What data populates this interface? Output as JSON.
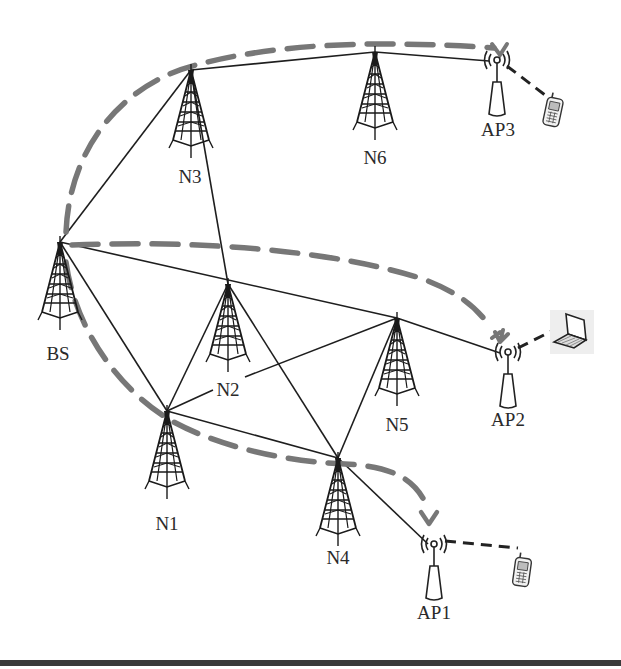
{
  "diagram": {
    "colors": {
      "link": "#1e1e1e",
      "route": "#777777",
      "wireless": "#222222",
      "background": "#ffffff"
    },
    "nodes": [
      {
        "id": "BS",
        "label": "BS",
        "type": "tower",
        "x": 60,
        "y": 242,
        "label_x": 58,
        "label_y": 360
      },
      {
        "id": "N1",
        "label": "N1",
        "type": "tower",
        "x": 167,
        "y": 411,
        "label_x": 167,
        "label_y": 530
      },
      {
        "id": "N2",
        "label": "N2",
        "type": "tower",
        "x": 228,
        "y": 284,
        "label_x": 228,
        "label_y": 396
      },
      {
        "id": "N3",
        "label": "N3",
        "type": "tower",
        "x": 191,
        "y": 70,
        "label_x": 190,
        "label_y": 183
      },
      {
        "id": "N4",
        "label": "N4",
        "type": "tower",
        "x": 338,
        "y": 458,
        "label_x": 338,
        "label_y": 564
      },
      {
        "id": "N5",
        "label": "N5",
        "type": "tower",
        "x": 397,
        "y": 318,
        "label_x": 397,
        "label_y": 431
      },
      {
        "id": "N6",
        "label": "N6",
        "type": "tower",
        "x": 375,
        "y": 52,
        "label_x": 375,
        "label_y": 164
      },
      {
        "id": "AP1",
        "label": "AP1",
        "type": "access-point",
        "x": 434,
        "y": 544,
        "label_x": 434,
        "label_y": 619
      },
      {
        "id": "AP2",
        "label": "AP2",
        "type": "access-point",
        "x": 508,
        "y": 352,
        "label_x": 508,
        "label_y": 426
      },
      {
        "id": "AP3",
        "label": "AP3",
        "type": "access-point",
        "x": 497,
        "y": 60,
        "label_x": 498,
        "label_y": 136
      }
    ],
    "links": [
      [
        "BS",
        "N3"
      ],
      [
        "BS",
        "N2"
      ],
      [
        "BS",
        "N1"
      ],
      [
        "BS",
        "N5"
      ],
      [
        "N3",
        "N6"
      ],
      [
        "N3",
        "N2"
      ],
      [
        "N6",
        "AP3"
      ],
      [
        "N2",
        "N1"
      ],
      [
        "N2",
        "N4"
      ],
      [
        "N1",
        "N5"
      ],
      [
        "N1",
        "N4"
      ],
      [
        "N5",
        "N4"
      ],
      [
        "N5",
        "AP2"
      ],
      [
        "N4",
        "AP1"
      ]
    ],
    "devices": [
      {
        "id": "phone-ap3",
        "type": "phone",
        "x": 553,
        "y": 112,
        "connected_to": "AP3"
      },
      {
        "id": "laptop-ap2",
        "type": "laptop",
        "x": 572,
        "y": 332,
        "connected_to": "AP2"
      },
      {
        "id": "phone-ap1",
        "type": "phone",
        "x": 522,
        "y": 572,
        "connected_to": "AP1"
      }
    ],
    "routes": [
      {
        "id": "route-to-ap3",
        "path": [
          "BS",
          "N3",
          "N6",
          "AP3"
        ]
      },
      {
        "id": "route-to-ap2",
        "path": [
          "BS",
          "AP2"
        ]
      },
      {
        "id": "route-to-ap1",
        "path": [
          "BS",
          "N1",
          "N4",
          "AP1"
        ]
      }
    ]
  }
}
